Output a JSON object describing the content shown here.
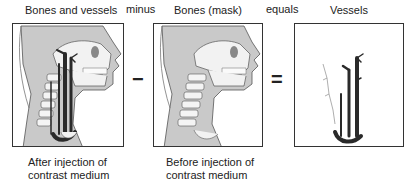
{
  "panels": [
    {
      "title": "Bones and vessels",
      "caption_line1": "After injection of",
      "caption_line2": "contrast medium"
    },
    {
      "title": "Bones (mask)",
      "caption_line1": "Before injection of",
      "caption_line2": "contrast medium"
    },
    {
      "title": "Vessels"
    }
  ],
  "operators": {
    "minus_word": "minus",
    "minus_symbol": "−",
    "equals_word": "equals",
    "equals_symbol": "="
  },
  "colors": {
    "tissue": "#c9c9c9",
    "bone": "#f4f4f4",
    "vessel": "#2a2a2a",
    "outline": "#333333"
  }
}
